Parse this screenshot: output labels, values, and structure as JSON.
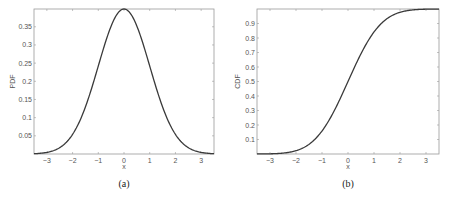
{
  "chart_data": [
    {
      "type": "line",
      "title": "",
      "caption": "(a)",
      "xlabel": "x",
      "ylabel": "PDF",
      "xlim": [
        -3.5,
        3.5
      ],
      "ylim": [
        0,
        0.3989
      ],
      "xticks": [
        -3,
        -2,
        -1,
        0,
        1,
        2,
        3
      ],
      "xtick_labels": [
        "−3",
        "−2",
        "−1",
        "0",
        "1",
        "2",
        "3"
      ],
      "yticks": [
        0.05,
        0.1,
        0.15,
        0.2,
        0.25,
        0.3,
        0.35
      ],
      "ytick_labels": [
        "0.05",
        "0.1",
        "0.15",
        "0.2",
        "0.25",
        "0.3",
        "0.35"
      ],
      "grid": false,
      "series": [
        {
          "name": "Standard normal PDF",
          "function": "pdf",
          "x": [
            -3.5,
            -3,
            -2.5,
            -2,
            -1.5,
            -1,
            -0.5,
            0,
            0.5,
            1,
            1.5,
            2,
            2.5,
            3,
            3.5
          ],
          "y": [
            0.0009,
            0.0044,
            0.0175,
            0.054,
            0.1295,
            0.242,
            0.3521,
            0.3989,
            0.3521,
            0.242,
            0.1295,
            0.054,
            0.0175,
            0.0044,
            0.0009
          ],
          "color": "#3a3a3a"
        }
      ]
    },
    {
      "type": "line",
      "title": "",
      "caption": "(b)",
      "xlabel": "x",
      "ylabel": "CDF",
      "xlim": [
        -3.5,
        3.5
      ],
      "ylim": [
        0,
        1
      ],
      "xticks": [
        -3,
        -2,
        -1,
        0,
        1,
        2,
        3
      ],
      "xtick_labels": [
        "−3",
        "−2",
        "−1",
        "0",
        "1",
        "2",
        "3"
      ],
      "yticks": [
        0.1,
        0.2,
        0.3,
        0.4,
        0.5,
        0.6,
        0.7,
        0.8,
        0.9
      ],
      "ytick_labels": [
        "0.1",
        "0.2",
        "0.3",
        "0.4",
        "0.5",
        "0.6",
        "0.7",
        "0.8",
        "0.9"
      ],
      "grid": false,
      "series": [
        {
          "name": "Standard normal CDF",
          "function": "cdf",
          "x": [
            -3.5,
            -3,
            -2.5,
            -2,
            -1.5,
            -1,
            -0.5,
            0,
            0.5,
            1,
            1.5,
            2,
            2.5,
            3,
            3.5
          ],
          "y": [
            0.0002,
            0.0013,
            0.0062,
            0.0228,
            0.0668,
            0.1587,
            0.3085,
            0.5,
            0.6915,
            0.8413,
            0.9332,
            0.9772,
            0.9938,
            0.9987,
            0.9998
          ],
          "color": "#3a3a3a"
        }
      ]
    }
  ]
}
